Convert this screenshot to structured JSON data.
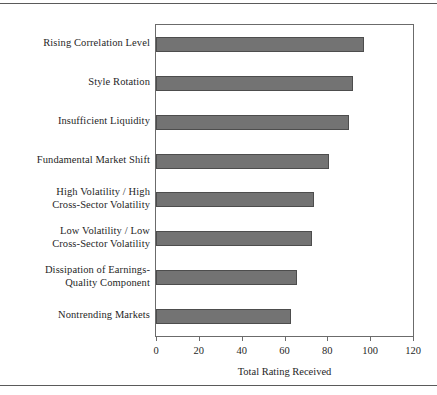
{
  "page": {
    "has_top_rule": true,
    "has_bottom_rule": true,
    "background_color": "#ffffff"
  },
  "style": {
    "bar_fill_color": "#737373",
    "bar_border_color": "#4d4d4d",
    "frame_color": "#6b6b6b",
    "text_color": "#1f1f1f"
  },
  "chart_data": {
    "type": "bar",
    "orientation": "horizontal",
    "title": "",
    "xlabel": "Total Rating Received",
    "ylabel": "",
    "xlim": [
      0,
      120
    ],
    "xticks": [
      0,
      20,
      40,
      60,
      80,
      100,
      120
    ],
    "xtick_labels": [
      "0",
      "20",
      "40",
      "60",
      "80",
      "100",
      "120"
    ],
    "grid": false,
    "legend": null,
    "categories": [
      "Rising Correlation Level",
      "Style Rotation",
      "Insufficient Liquidity",
      "Fundamental Market Shift",
      "High Volatility / High\nCross-Sector Volatility",
      "Low Volatility / Low\nCross-Sector Volatility",
      "Dissipation of Earnings-\nQuality Component",
      "Nontrending Markets"
    ],
    "values": [
      97,
      92,
      90,
      81,
      74,
      73,
      66,
      63
    ]
  }
}
